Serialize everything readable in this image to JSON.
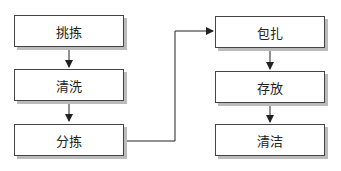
{
  "left_column": [
    {
      "label": "挑拣"
    },
    {
      "label": "清洗"
    },
    {
      "label": "分拣"
    }
  ],
  "right_column": [
    {
      "label": "包扎"
    },
    {
      "label": "存放"
    },
    {
      "label": "清洁"
    }
  ]
}
